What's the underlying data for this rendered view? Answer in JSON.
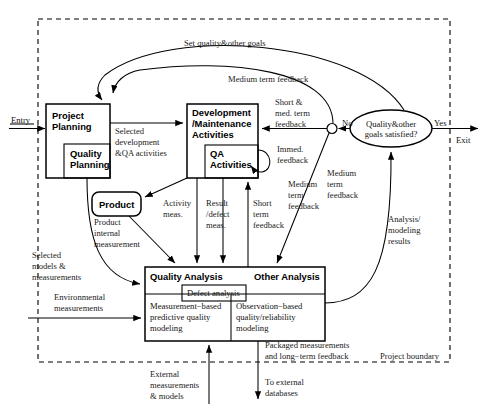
{
  "diagram": {
    "boundary_label": "Project boundary",
    "entry_label": "Entry",
    "exit_label": "Exit",
    "decision": {
      "text_line1": "Quality&other",
      "text_line2": "goals satisfied?",
      "yes_label": "Yes",
      "no_label": "No"
    },
    "nodes": {
      "project_planning": "Project\nPlanning",
      "project_planning_l1": "Project",
      "project_planning_l2": "Planning",
      "quality_planning_l1": "Quality",
      "quality_planning_l2": "Planning",
      "development_l1": "Development",
      "development_l2": "/Maintenance",
      "development_l3": "Activities",
      "qa_activities_l1": "QA",
      "qa_activities_l2": "Activities",
      "product": "Product",
      "quality_analysis": "Quality Analysis",
      "other_analysis": "Other Analysis",
      "defect_analysis": "Defect analysis",
      "measurement_based_l1": "Measurement−based",
      "measurement_based_l2": "predictive quality",
      "measurement_based_l3": "modeling",
      "observation_based_l1": "Observation−based",
      "observation_based_l2": "quality/reliability",
      "observation_based_l3": "modeling"
    },
    "edges": {
      "set_goals": "Set quality&other goals",
      "medium_term_feedback_top": "Medium term feedback",
      "selected_dev_l1": "Selected",
      "selected_dev_l2": "development",
      "selected_dev_l3": "&QA activities",
      "short_med_l1": "Short &",
      "short_med_l2": "med. term",
      "short_med_l3": "feedback",
      "immed_l1": "Immed.",
      "immed_l2": "feedback",
      "activity_meas_l1": "Activity",
      "activity_meas_l2": "meas.",
      "result_defect_l1": "Result",
      "result_defect_l2": "/defect",
      "result_defect_l3": "meas.",
      "short_term_l1": "Short",
      "short_term_l2": "term",
      "short_term_l3": "feedback",
      "medium_term_mid_l1": "Medium",
      "medium_term_mid_l2": "term",
      "medium_term_mid_l3": "feedback",
      "medium_term_right_l1": "Medium",
      "medium_term_right_l2": "term",
      "medium_term_right_l3": "feedback",
      "analysis_results_l1": "Analysis/",
      "analysis_results_l2": "modeling",
      "analysis_results_l3": "results",
      "product_internal_l1": "Product",
      "product_internal_l2": "internal",
      "product_internal_l3": "measurement",
      "selected_models_l1": "Selected",
      "selected_models_l2": "models &",
      "selected_models_l3": "measurements",
      "environmental_l1": "Environmental",
      "environmental_l2": "measurements",
      "external_meas_l1": "External",
      "external_meas_l2": "measurements",
      "external_meas_l3": "& models",
      "packaged_l1": "Packaged measurements",
      "packaged_l2": "and long−term feedback",
      "to_external_l1": "To external",
      "to_external_l2": "databases"
    }
  }
}
